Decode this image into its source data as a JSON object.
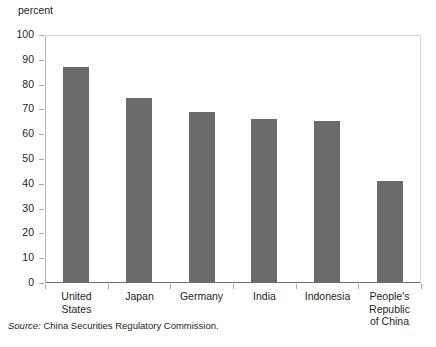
{
  "chart_data": {
    "type": "bar",
    "title": "",
    "subtitle": "",
    "xlabel": "",
    "ylabel": "percent",
    "ylim": [
      0,
      100
    ],
    "yticks": [
      "0",
      "10",
      "20",
      "30",
      "40",
      "50",
      "60",
      "70",
      "80",
      "90",
      "100"
    ],
    "grid": false,
    "legend": "none",
    "bar_color": "#6b6b6b",
    "categories": [
      "United States",
      "Japan",
      "Germany",
      "India",
      "Indonesia",
      "People's Republic of China"
    ],
    "category_lines": [
      [
        "United States"
      ],
      [
        "Japan"
      ],
      [
        "Germany"
      ],
      [
        "India"
      ],
      [
        "Indonesia"
      ],
      [
        "People's",
        "Republic",
        "of China"
      ]
    ],
    "values": [
      87,
      74.5,
      69,
      66,
      65.5,
      41
    ]
  },
  "unit_label": "percent",
  "source": {
    "label": "Source:",
    "text": "China Securities Regulatory Commission."
  }
}
